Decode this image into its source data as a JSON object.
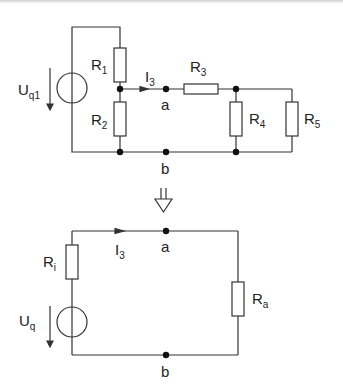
{
  "original_circuit": {
    "source": {
      "name": "U",
      "sub": "q1"
    },
    "resistors": [
      {
        "name": "R",
        "sub": "1"
      },
      {
        "name": "R",
        "sub": "2"
      },
      {
        "name": "R",
        "sub": "3"
      },
      {
        "name": "R",
        "sub": "4"
      },
      {
        "name": "R",
        "sub": "5"
      }
    ],
    "current": {
      "name": "I",
      "sub": "3"
    },
    "nodes": {
      "a": "a",
      "b": "b"
    }
  },
  "transform_arrow": "equivalent",
  "equivalent_circuit": {
    "source": {
      "name": "U",
      "sub": "q"
    },
    "internal_resistor": {
      "name": "R",
      "sub": "i"
    },
    "load_resistor": {
      "name": "R",
      "sub": "a"
    },
    "current": {
      "name": "I",
      "sub": "3"
    },
    "nodes": {
      "a": "a",
      "b": "b"
    }
  },
  "colors": {
    "wire": "#333333",
    "background": "#ffffff"
  }
}
